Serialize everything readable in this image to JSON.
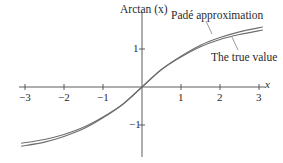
{
  "chart_data": {
    "type": "line",
    "title": "",
    "xlabel": "x",
    "ylabel": "Arctan (x)",
    "xlim": [
      -3.1,
      3.15
    ],
    "ylim": [
      -1.95,
      2.2
    ],
    "grid": false,
    "legend_position": "inline annotations",
    "x_ticks": [
      -3,
      -2,
      -1,
      1,
      2,
      3
    ],
    "x_tick_labels": [
      "−3",
      "−2",
      "−1",
      "1",
      "2",
      "3"
    ],
    "y_ticks": [
      1,
      -1
    ],
    "y_tick_labels": [
      "1",
      "−1"
    ],
    "series": [
      {
        "name": "Padé approximation",
        "x": [
          -3.1,
          -2.5,
          -2,
          -1.5,
          -1,
          -0.5,
          0,
          0.5,
          1,
          1.5,
          2,
          2.5,
          3.1
        ],
        "y": [
          -1.56,
          -1.45,
          -1.3,
          -1.1,
          -0.81,
          -0.46,
          0,
          0.46,
          0.81,
          1.1,
          1.3,
          1.45,
          1.58
        ]
      },
      {
        "name": "The true value",
        "x": [
          -3.1,
          -2.5,
          -2,
          -1.5,
          -1,
          -0.5,
          0,
          0.5,
          1,
          1.5,
          2,
          2.5,
          3.1
        ],
        "y": [
          -1.48,
          -1.38,
          -1.25,
          -1.06,
          -0.79,
          -0.46,
          0,
          0.46,
          0.79,
          1.06,
          1.25,
          1.38,
          1.5
        ]
      }
    ],
    "annotations": [
      {
        "text": "Padé approximation",
        "points_to_series": 0
      },
      {
        "text": "The true value",
        "points_to_series": 1
      }
    ]
  },
  "labels": {
    "y_axis": "Arctan (x)",
    "x_axis": "x",
    "pade": "Padé approximation",
    "true_value": "The true value",
    "xticks": [
      "−3",
      "−2",
      "−1",
      "1",
      "2",
      "3"
    ],
    "yticks": [
      "1",
      "−1"
    ]
  },
  "colors": {
    "axis": "#4a4a4a",
    "curve": "#6e6e6e",
    "text": "#2a2a2a"
  }
}
